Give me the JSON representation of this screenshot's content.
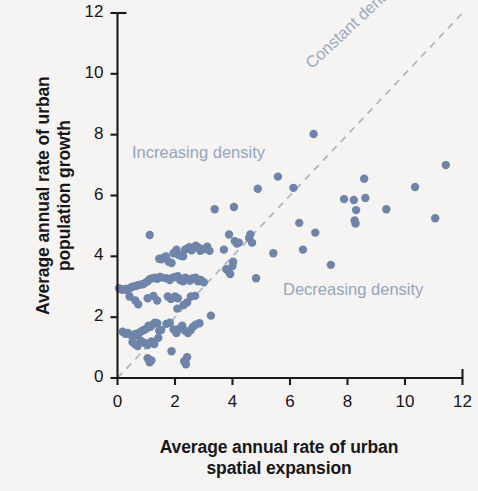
{
  "figure": {
    "background_color": "#f5f4f2",
    "point_color": "#6e84a8",
    "annotation_color": "#94a4bd",
    "axis_color": "#1a1a1e"
  },
  "axes": {
    "x_title": "Average annual rate of urban\nspatial expansion",
    "y_title": "Average annual rate of urban\npopulation growth",
    "x_ticks": [
      "0",
      "2",
      "4",
      "6",
      "8",
      "10",
      "12"
    ],
    "y_ticks": [
      "0",
      "2",
      "4",
      "6",
      "8",
      "10",
      "12"
    ]
  },
  "annotations": {
    "increasing": "Increasing density",
    "decreasing": "Decreasing density",
    "constant": "Constant density"
  },
  "chart_data": {
    "type": "scatter",
    "title": "",
    "xlabel": "Average annual rate of urban spatial expansion",
    "ylabel": "Average annual rate of urban population growth",
    "xlim": [
      0,
      12
    ],
    "ylim": [
      0,
      12
    ],
    "xticks": [
      0,
      2,
      4,
      6,
      8,
      10,
      12
    ],
    "yticks": [
      0,
      2,
      4,
      6,
      8,
      10,
      12
    ],
    "grid": false,
    "legend": "none",
    "reference_line": {
      "label": "Constant density",
      "style": "dashed",
      "color": "#a9b4c5",
      "from": [
        0,
        0
      ],
      "to": [
        12,
        12
      ],
      "slope": 1,
      "intercept": 0
    },
    "annotations": [
      {
        "text": "Increasing density",
        "x": 0.7,
        "y": 7.75,
        "rotation": 0
      },
      {
        "text": "Decreasing density",
        "x": 5.8,
        "y": 3.2,
        "rotation": 0
      },
      {
        "text": "Constant density",
        "x": 6.8,
        "y": 10.9,
        "rotation": 43
      }
    ],
    "series": [
      {
        "name": "Cities",
        "marker": "circle",
        "color": "#6e84a8",
        "points": [
          [
            0.05,
            2.95
          ],
          [
            0.12,
            2.92
          ],
          [
            0.18,
            2.9
          ],
          [
            0.28,
            2.93
          ],
          [
            0.36,
            2.88
          ],
          [
            0.45,
            2.97
          ],
          [
            0.52,
            3.0
          ],
          [
            0.62,
            3.02
          ],
          [
            0.7,
            3.05
          ],
          [
            0.78,
            3.07
          ],
          [
            0.88,
            3.08
          ],
          [
            0.95,
            3.12
          ],
          [
            1.05,
            3.18
          ],
          [
            1.12,
            3.25
          ],
          [
            1.22,
            3.28
          ],
          [
            1.3,
            3.3
          ],
          [
            1.38,
            3.26
          ],
          [
            1.48,
            3.32
          ],
          [
            1.55,
            3.3
          ],
          [
            0.42,
            2.68
          ],
          [
            0.62,
            2.55
          ],
          [
            0.72,
            2.42
          ],
          [
            1.05,
            2.62
          ],
          [
            1.25,
            2.7
          ],
          [
            1.38,
            2.55
          ],
          [
            1.12,
            4.7
          ],
          [
            1.45,
            3.92
          ],
          [
            1.52,
            3.9
          ],
          [
            1.6,
            3.95
          ],
          [
            1.68,
            4.0
          ],
          [
            1.78,
            3.82
          ],
          [
            1.88,
            3.78
          ],
          [
            1.95,
            4.1
          ],
          [
            2.05,
            4.22
          ],
          [
            2.12,
            4.05
          ],
          [
            2.2,
            4.02
          ],
          [
            2.28,
            4.0
          ],
          [
            2.35,
            4.22
          ],
          [
            2.42,
            4.25
          ],
          [
            2.5,
            4.3
          ],
          [
            2.58,
            4.2
          ],
          [
            2.65,
            4.28
          ],
          [
            2.72,
            4.35
          ],
          [
            2.8,
            4.3
          ],
          [
            2.88,
            4.18
          ],
          [
            2.96,
            4.22
          ],
          [
            3.05,
            4.25
          ],
          [
            3.12,
            4.32
          ],
          [
            3.2,
            4.18
          ],
          [
            1.7,
            3.28
          ],
          [
            1.82,
            3.22
          ],
          [
            1.92,
            3.3
          ],
          [
            2.0,
            3.32
          ],
          [
            2.1,
            3.35
          ],
          [
            2.18,
            3.22
          ],
          [
            2.28,
            3.18
          ],
          [
            2.36,
            3.3
          ],
          [
            2.44,
            3.25
          ],
          [
            2.52,
            3.2
          ],
          [
            2.62,
            3.28
          ],
          [
            2.72,
            3.3
          ],
          [
            2.8,
            3.18
          ],
          [
            2.9,
            3.22
          ],
          [
            3.0,
            3.15
          ],
          [
            1.75,
            2.68
          ],
          [
            1.86,
            2.6
          ],
          [
            2.0,
            2.68
          ],
          [
            2.1,
            2.62
          ],
          [
            2.3,
            2.4
          ],
          [
            2.42,
            2.48
          ],
          [
            2.55,
            2.68
          ],
          [
            2.7,
            2.7
          ],
          [
            2.08,
            2.28
          ],
          [
            3.25,
            2.05
          ],
          [
            0.18,
            1.52
          ],
          [
            0.28,
            1.45
          ],
          [
            0.36,
            1.48
          ],
          [
            0.45,
            1.42
          ],
          [
            0.55,
            1.38
          ],
          [
            0.62,
            1.45
          ],
          [
            0.7,
            1.4
          ],
          [
            0.78,
            1.5
          ],
          [
            0.85,
            1.55
          ],
          [
            0.92,
            1.58
          ],
          [
            1.0,
            1.62
          ],
          [
            1.08,
            1.72
          ],
          [
            1.15,
            1.68
          ],
          [
            1.22,
            1.75
          ],
          [
            1.3,
            1.82
          ],
          [
            1.38,
            1.8
          ],
          [
            1.45,
            1.55
          ],
          [
            1.52,
            1.58
          ],
          [
            0.52,
            1.18
          ],
          [
            0.62,
            1.1
          ],
          [
            0.7,
            1.05
          ],
          [
            0.82,
            1.22
          ],
          [
            0.95,
            1.15
          ],
          [
            1.05,
            1.08
          ],
          [
            1.18,
            1.2
          ],
          [
            1.28,
            1.12
          ],
          [
            1.42,
            1.32
          ],
          [
            1.7,
            1.78
          ],
          [
            1.82,
            1.82
          ],
          [
            1.95,
            1.6
          ],
          [
            2.05,
            1.48
          ],
          [
            2.15,
            1.62
          ],
          [
            2.25,
            1.72
          ],
          [
            2.35,
            1.55
          ],
          [
            2.45,
            1.48
          ],
          [
            2.55,
            1.58
          ],
          [
            2.62,
            1.68
          ],
          [
            2.72,
            1.75
          ],
          [
            2.85,
            1.8
          ],
          [
            1.88,
            0.88
          ],
          [
            1.05,
            0.65
          ],
          [
            1.12,
            0.52
          ],
          [
            1.18,
            0.58
          ],
          [
            2.32,
            0.55
          ],
          [
            2.38,
            0.45
          ],
          [
            2.42,
            0.68
          ],
          [
            3.38,
            5.55
          ],
          [
            3.7,
            4.22
          ],
          [
            3.78,
            3.58
          ],
          [
            3.85,
            3.52
          ],
          [
            3.92,
            3.42
          ],
          [
            4.0,
            3.68
          ],
          [
            4.02,
            3.82
          ],
          [
            4.08,
            4.5
          ],
          [
            4.05,
            5.62
          ],
          [
            3.88,
            4.72
          ],
          [
            4.15,
            4.42
          ],
          [
            4.22,
            4.45
          ],
          [
            4.58,
            4.6
          ],
          [
            4.62,
            4.72
          ],
          [
            4.68,
            4.45
          ],
          [
            4.88,
            6.22
          ],
          [
            4.82,
            3.28
          ],
          [
            5.42,
            4.1
          ],
          [
            5.58,
            6.62
          ],
          [
            6.12,
            6.25
          ],
          [
            6.32,
            5.1
          ],
          [
            6.82,
            8.02
          ],
          [
            6.88,
            4.78
          ],
          [
            6.45,
            4.22
          ],
          [
            7.42,
            3.72
          ],
          [
            7.88,
            5.88
          ],
          [
            8.22,
            5.85
          ],
          [
            8.3,
            5.52
          ],
          [
            8.25,
            5.18
          ],
          [
            8.28,
            5.08
          ],
          [
            8.58,
            6.55
          ],
          [
            8.62,
            5.92
          ],
          [
            9.35,
            5.55
          ],
          [
            10.35,
            6.28
          ],
          [
            11.05,
            5.25
          ],
          [
            11.42,
            7.0
          ]
        ]
      }
    ]
  }
}
